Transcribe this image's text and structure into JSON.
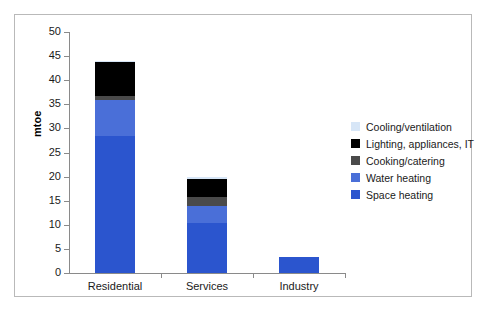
{
  "chart_data": {
    "type": "bar",
    "subtype": "stacked-bar",
    "title": "",
    "xlabel": "",
    "ylabel": "mtoe",
    "ylim": [
      0,
      50
    ],
    "yticks": [
      0,
      5,
      10,
      15,
      20,
      25,
      30,
      35,
      40,
      45,
      50
    ],
    "grid": false,
    "legend_position": "right",
    "categories": [
      "Residential",
      "Services",
      "Industry"
    ],
    "series": [
      {
        "name": "Space heating",
        "color": "#2B55CE",
        "values": [
          28.5,
          10.4,
          3.3
        ]
      },
      {
        "name": "Water heating",
        "color": "#4A6FD8",
        "values": [
          7.3,
          3.5,
          0
        ]
      },
      {
        "name": "Cooking/catering",
        "color": "#4A4A4A",
        "values": [
          1.0,
          1.9,
          0
        ]
      },
      {
        "name": "Lighting, appliances, IT",
        "color": "#000000",
        "values": [
          7.0,
          3.7,
          0
        ]
      },
      {
        "name": "Cooling/ventilation",
        "color": "#D7E6F7",
        "values": [
          0.2,
          0.5,
          0
        ]
      }
    ],
    "totals": [
      44.0,
      20.0,
      3.3
    ],
    "legend_order": [
      "Cooling/ventilation",
      "Lighting, appliances, IT",
      "Cooking/catering",
      "Water heating",
      "Space heating"
    ]
  },
  "axis": {
    "y_title": "mtoe",
    "y_tick_labels": [
      "50",
      "45",
      "40",
      "35",
      "30",
      "25",
      "20",
      "15",
      "10",
      "5",
      "0"
    ],
    "x_tick_labels": [
      "Residential",
      "Services",
      "Industry"
    ]
  },
  "legend": {
    "items": [
      {
        "label": "Cooling/ventilation",
        "color": "#D7E6F7"
      },
      {
        "label": "Lighting, appliances, IT",
        "color": "#000000"
      },
      {
        "label": "Cooking/catering",
        "color": "#4A4A4A"
      },
      {
        "label": "Water heating",
        "color": "#4A6FD8"
      },
      {
        "label": "Space heating",
        "color": "#2B55CE"
      }
    ]
  },
  "colors": {
    "frame_border": "#b9b9b9",
    "axis_line": "#8a8a8a",
    "background": "#ffffff",
    "text": "#1a1a1a"
  }
}
